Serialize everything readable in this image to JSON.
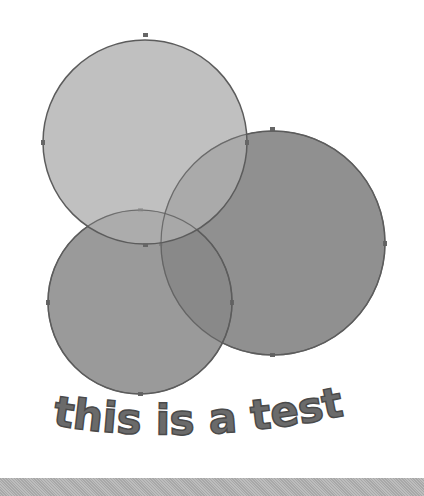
{
  "caption": {
    "text": "this is a test"
  },
  "shapes": [
    {
      "name": "circle-top-left",
      "cx": 145,
      "cy": 142,
      "r": 102,
      "fill": "#a6a6a6",
      "stroke": "#5c5c5c"
    },
    {
      "name": "circle-right",
      "cx": 273,
      "cy": 243,
      "r": 112,
      "fill": "#8a8a8a",
      "stroke": "#5c5c5c"
    },
    {
      "name": "circle-bottom-left",
      "cx": 140,
      "cy": 302,
      "r": 92,
      "fill": "#888888",
      "stroke": "#5c5c5c"
    }
  ],
  "colors": {
    "background": "#ffffff",
    "bar": "#b4b4b4",
    "text": "#6a6a6a"
  }
}
